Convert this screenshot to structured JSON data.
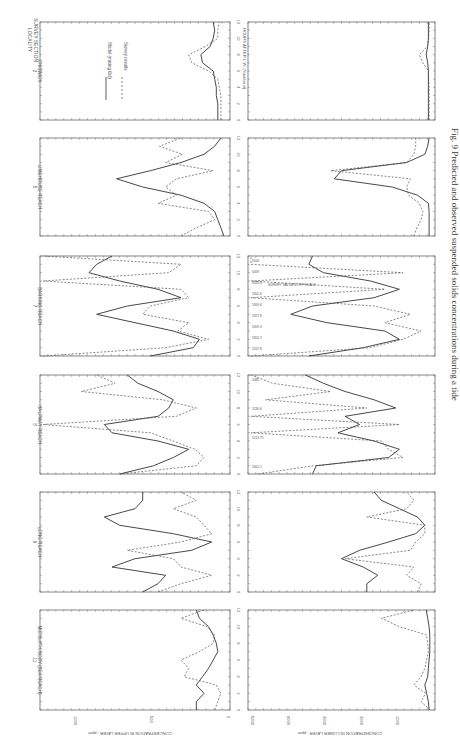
{
  "page": {
    "orientation": "rotated 90 degrees clockwise",
    "caption": "Fig. 9 Predicted and observed suspended solids concentrations during a tide",
    "header_label_line1": "SURVEY SECTION",
    "header_label_line2": "LOCALITY"
  },
  "legend": {
    "model_label": "Model (mixing tbd)",
    "survey_label": "Survey results"
  },
  "axes": {
    "time_label": "HOURS AFTER L.W. (Southend)",
    "time_ticks": [
      "0",
      "2",
      "4",
      "6",
      "8",
      "10",
      "12"
    ],
    "upper_label": "CONCENTRATION IN UPPER LAYER : ppm",
    "upper_ticks": [
      "0",
      "500",
      "1000"
    ],
    "lower_label": "CONCENTRATION IN LOWER LAYER : ppm",
    "lower_ticks": [
      "1000",
      "2000",
      "3000",
      "4000",
      "5000"
    ]
  },
  "chart_data": {
    "type": "line",
    "title": "Predicted and observed suspended solids concentrations during a tide",
    "xlabel": "HOURS AFTER L.W. (Southend)",
    "x": [
      0,
      1,
      2,
      3,
      4,
      5,
      6,
      7,
      8,
      9,
      10,
      11,
      12
    ],
    "panels": [
      {
        "section": "2",
        "locality": "CHISWICK",
        "upper": {
          "ylim": [
            0,
            1200
          ],
          "model": [
            60,
            60,
            60,
            70,
            70,
            80,
            90,
            160,
            170,
            110,
            90,
            80,
            90
          ],
          "survey": [
            40,
            40,
            40,
            40,
            50,
            60,
            120,
            230,
            250,
            140,
            60,
            60,
            50
          ]
        },
        "lower": {
          "ylim": [
            0,
            5000
          ],
          "model": [
            100,
            100,
            100,
            100,
            100,
            100,
            100,
            120,
            160,
            120,
            100,
            100,
            100
          ],
          "survey": [
            80,
            80,
            80,
            80,
            80,
            90,
            100,
            250,
            350,
            130,
            90,
            80,
            80
          ]
        }
      },
      {
        "section": "5",
        "locality": "LIMEHOUSE REACH",
        "upper": {
          "ylim": [
            0,
            1200
          ],
          "model": [
            20,
            40,
            60,
            80,
            150,
            300,
            550,
            720,
            500,
            300,
            150,
            80,
            40
          ],
          "survey": [
            300,
            200,
            80,
            120,
            450,
            330,
            400,
            330,
            90,
            400,
            290,
            440,
            300
          ]
        },
        "lower": {
          "ylim": [
            0,
            5000
          ],
          "model": [
            80,
            80,
            80,
            80,
            100,
            400,
            1100,
            2700,
            2500,
            700,
            200,
            120,
            80
          ],
          "survey": [
            500,
            420,
            300,
            250,
            350,
            650,
            700,
            600,
            2800,
            700,
            500,
            450,
            450
          ]
        }
      },
      {
        "section": "7",
        "locality": "BARKING REACH",
        "upper": {
          "ylim": [
            0,
            1200
          ],
          "model": [
            500,
            220,
            180,
            350,
            600,
            850,
            650,
            300,
            450,
            700,
            900,
            850,
            750
          ],
          "survey": [
            1200,
            400,
            120,
            320,
            250,
            550,
            500,
            250,
            300,
            1200,
            380,
            300,
            1200
          ]
        },
        "lower": {
          "ylim": [
            0,
            5000
          ],
          "model": [
            3400,
            1900,
            900,
            1300,
            2900,
            3900,
            3300,
            1600,
            900,
            1700,
            3000,
            3400,
            3300
          ],
          "survey": [
            5000,
            1700,
            800,
            300,
            1300,
            600,
            1600,
            5000,
            1300,
            5000,
            800,
            5000,
            5000
          ]
        },
        "off_scale_annotations": [
          "5506",
          "5059",
          "5326.4",
          "5301.6",
          "5309.6",
          "5327.8",
          "5309.3",
          "5302.2",
          "5207.8"
        ],
        "annotation_note": "SURVEY VALUES OFF SCALE"
      },
      {
        "section": "8",
        "locality": "HALFWAY REACH",
        "upper": {
          "ylim": [
            0,
            1200
          ],
          "model": [
            700,
            480,
            350,
            250,
            450,
            750,
            800,
            450,
            380,
            350,
            450,
            580,
            650
          ],
          "survey": [
            700,
            200,
            150,
            210,
            350,
            500,
            1200,
            330,
            200,
            420,
            950,
            730,
            850
          ]
        },
        "lower": {
          "ylim": [
            0,
            5000
          ],
          "model": [
            3300,
            3200,
            1200,
            900,
            1600,
            2600,
            2000,
            2400,
            1000,
            1600,
            2400,
            3000,
            3500
          ],
          "survey": [
            4800,
            3300,
            800,
            1200,
            1400,
            5000,
            900,
            5000,
            1800,
            4600,
            2800,
            4400,
            5000
          ]
        },
        "off_scale_annotations": [
          "5485",
          "5230.6",
          "5213.75",
          "5301.2"
        ]
      },
      {
        "section": "9",
        "locality": "LONG REACH",
        "upper": {
          "ylim": [
            0,
            1200
          ],
          "model": [
            550,
            450,
            400,
            750,
            600,
            230,
            100,
            350,
            700,
            800,
            600,
            550,
            550
          ],
          "survey": [
            450,
            300,
            100,
            300,
            350,
            650,
            300,
            100,
            150,
            200,
            350,
            200,
            300
          ]
        },
        "lower": {
          "ylim": [
            0,
            5000
          ],
          "model": [
            1800,
            1800,
            1500,
            1900,
            2500,
            2000,
            1200,
            450,
            200,
            400,
            900,
            1400,
            1600
          ],
          "survey": [
            400,
            300,
            700,
            500,
            2400,
            600,
            450,
            200,
            200,
            1800,
            700,
            500,
            700
          ]
        }
      },
      {
        "section": "11",
        "locality": "MID BLYTH BODY (SEA REACH)",
        "upper": {
          "ylim": [
            0,
            1200
          ],
          "model": [
            200,
            200,
            150,
            200,
            160,
            120,
            90,
            60,
            70,
            90,
            120,
            180,
            200
          ],
          "survey": [
            80,
            60,
            40,
            70,
            280,
            250,
            300,
            180,
            90,
            80,
            130,
            300,
            150
          ]
        },
        "lower": {
          "ylim": [
            0,
            5000
          ],
          "model": [
            80,
            100,
            150,
            200,
            120,
            100,
            80,
            60,
            60,
            60,
            80,
            120,
            160
          ],
          "survey": [
            50,
            300,
            180,
            500,
            300,
            200,
            150,
            100,
            120,
            150,
            900,
            1400,
            500
          ]
        }
      }
    ],
    "legend": [
      "Model (mixing tbd)",
      "Survey results"
    ],
    "grid": false
  }
}
